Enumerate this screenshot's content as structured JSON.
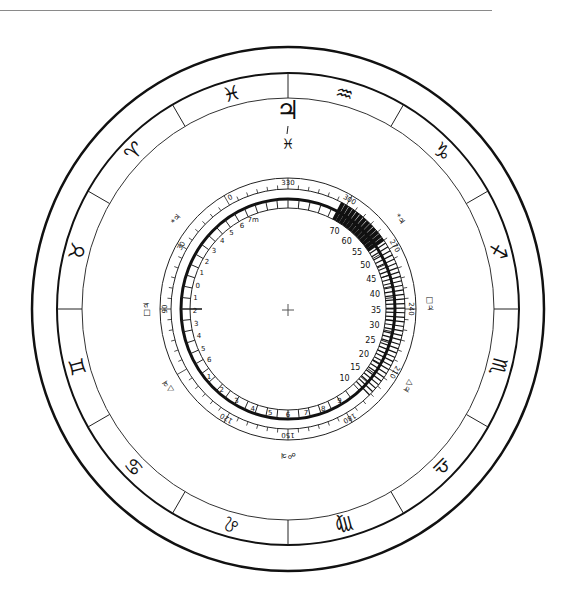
{
  "diagram": {
    "type": "astrological-dial",
    "center_marker": "+",
    "zodiac_ring": {
      "signs": [
        {
          "name": "pisces",
          "glyph": "♓",
          "angle": -105
        },
        {
          "name": "aries",
          "glyph": "♈",
          "angle": -135
        },
        {
          "name": "taurus",
          "glyph": "♉",
          "angle": -165
        },
        {
          "name": "gemini",
          "glyph": "♊",
          "angle": 165
        },
        {
          "name": "cancer",
          "glyph": "♋",
          "angle": 135
        },
        {
          "name": "leo",
          "glyph": "♌",
          "angle": 105
        },
        {
          "name": "virgo",
          "glyph": "♍",
          "angle": 75
        },
        {
          "name": "libra",
          "glyph": "♎",
          "angle": 45
        },
        {
          "name": "scorpio",
          "glyph": "♏",
          "angle": 15
        },
        {
          "name": "sagittarius",
          "glyph": "♐",
          "angle": -15
        },
        {
          "name": "capricorn",
          "glyph": "♑",
          "angle": -45
        },
        {
          "name": "aquarius",
          "glyph": "♒",
          "angle": -75
        }
      ]
    },
    "top_marker": {
      "planet": "♃",
      "sign": "♓"
    },
    "aspect_labels": [
      {
        "label": "*♃",
        "angle": -38
      },
      {
        "label": "□♃",
        "angle": -2
      },
      {
        "label": "△♃",
        "angle": 32
      },
      {
        "label": "☍♃",
        "angle": 90
      },
      {
        "label": "△♃",
        "angle": 148
      },
      {
        "label": "□♃",
        "angle": 180
      },
      {
        "label": "*♃",
        "angle": -142
      }
    ],
    "degree_scale": {
      "labels": [
        {
          "text": "330",
          "angle": -90
        },
        {
          "text": "300",
          "angle": -60
        },
        {
          "text": "270",
          "angle": -30
        },
        {
          "text": "240",
          "angle": 0
        },
        {
          "text": "210",
          "angle": 30
        },
        {
          "text": "180",
          "angle": 60
        },
        {
          "text": "150",
          "angle": 90
        },
        {
          "text": "120",
          "angle": 120
        },
        {
          "text": "90",
          "angle": 180
        },
        {
          "text": "30",
          "angle": -150
        },
        {
          "text": "0",
          "angle": -118
        }
      ]
    },
    "inner_scale": {
      "left_labels": [
        "7m",
        "6",
        "5",
        "4",
        "3",
        "2",
        "1",
        "0",
        "1",
        "2",
        "3",
        "4",
        "5",
        "6"
      ],
      "bottom_labels": [
        "1",
        "2",
        "3",
        "4",
        "5",
        "6",
        "7",
        "8",
        "9"
      ],
      "right_labels": [
        "10",
        "15",
        "20",
        "25",
        "30",
        "35",
        "40",
        "45",
        "50",
        "55",
        "60",
        "70"
      ]
    }
  }
}
